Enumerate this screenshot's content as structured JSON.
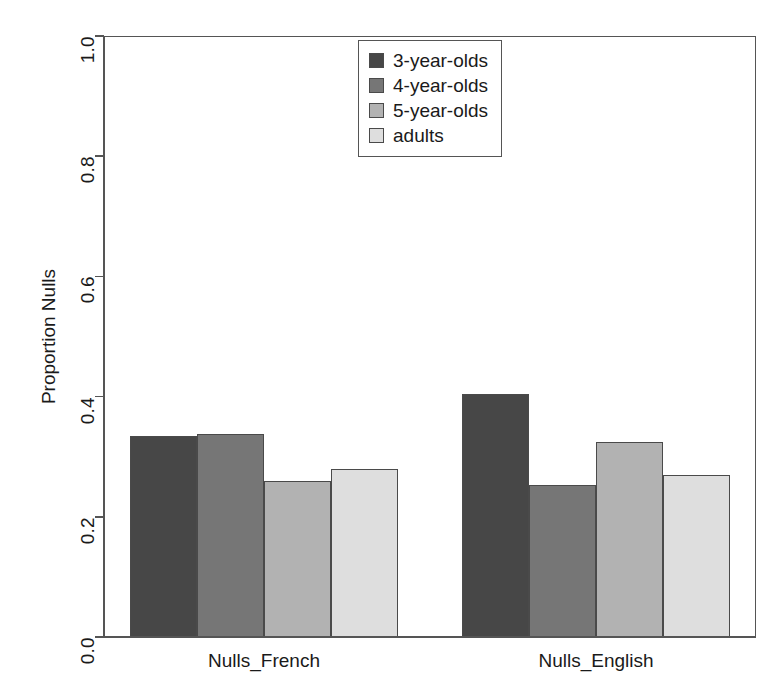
{
  "chart_data": {
    "type": "bar",
    "title": "",
    "xlabel": "",
    "ylabel": "Proportion Nulls",
    "categories": [
      "Nulls_French",
      "Nulls_English"
    ],
    "series": [
      {
        "name": "3-year-olds",
        "color": "#474747",
        "values": [
          0.335,
          0.405
        ]
      },
      {
        "name": "4-year-olds",
        "color": "#767676",
        "values": [
          0.337,
          0.253
        ]
      },
      {
        "name": "5-year-olds",
        "color": "#b2b2b2",
        "values": [
          0.26,
          0.325
        ]
      },
      {
        "name": "adults",
        "color": "#dedede",
        "values": [
          0.28,
          0.27
        ]
      }
    ],
    "ylim": [
      0.0,
      1.0
    ],
    "ytick_labels": [
      "0.0",
      "0.2",
      "0.4",
      "0.6",
      "0.8",
      "1.0"
    ],
    "ytick_values": [
      0.0,
      0.2,
      0.4,
      0.6,
      0.8,
      1.0
    ],
    "grid": false,
    "legend_position": "top-center",
    "bar_edge_color": "#4a4a4a",
    "axis_color": "#555555",
    "background": "#ffffff"
  },
  "legend": {
    "entries": [
      {
        "label": "3-year-olds",
        "color": "#474747"
      },
      {
        "label": "4-year-olds",
        "color": "#767676"
      },
      {
        "label": "5-year-olds",
        "color": "#b2b2b2"
      },
      {
        "label": "adults",
        "color": "#dedede"
      }
    ]
  }
}
